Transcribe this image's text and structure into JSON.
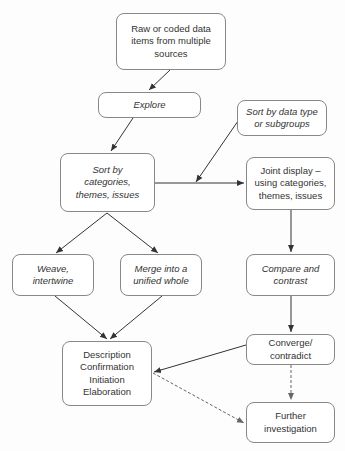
{
  "diagram": {
    "type": "flowchart",
    "nodes": [
      {
        "id": "raw",
        "text": "Raw or coded data\nitems from multiple\nsources",
        "italic": false
      },
      {
        "id": "explore",
        "text": "Explore",
        "italic": true
      },
      {
        "id": "sort_type",
        "text": "Sort by data type\nor subgroups",
        "italic": true
      },
      {
        "id": "sort_cat",
        "text": "Sort by\ncategories,\nthemes, issues",
        "italic": true
      },
      {
        "id": "joint",
        "text": "Joint display –\nusing categories,\nthemes, issues",
        "italic": false
      },
      {
        "id": "weave",
        "text": "Weave,\nintertwine",
        "italic": true
      },
      {
        "id": "merge",
        "text": "Merge into a\nunified whole",
        "italic": true
      },
      {
        "id": "compare",
        "text": "Compare and\ncontrast",
        "italic": true
      },
      {
        "id": "converge",
        "text": "Converge/\ncontradict",
        "italic": false
      },
      {
        "id": "description",
        "text": "Description\nConfirmation\nInitiation\nElaboration",
        "italic": false
      },
      {
        "id": "further",
        "text": "Further\ninvestigation",
        "italic": false
      }
    ],
    "edges": [
      {
        "from": "raw",
        "to": "explore",
        "style": "solid"
      },
      {
        "from": "explore",
        "to": "sort_cat",
        "style": "solid"
      },
      {
        "from": "sort_type",
        "to": "sort_cat-joint edge",
        "style": "solid"
      },
      {
        "from": "sort_cat",
        "to": "joint",
        "style": "solid"
      },
      {
        "from": "sort_cat",
        "to": "weave",
        "style": "solid"
      },
      {
        "from": "sort_cat",
        "to": "merge",
        "style": "solid"
      },
      {
        "from": "joint",
        "to": "compare",
        "style": "solid"
      },
      {
        "from": "weave",
        "to": "description",
        "style": "solid"
      },
      {
        "from": "merge",
        "to": "description",
        "style": "solid"
      },
      {
        "from": "compare",
        "to": "converge",
        "style": "solid"
      },
      {
        "from": "converge",
        "to": "description",
        "style": "solid"
      },
      {
        "from": "converge",
        "to": "further",
        "style": "dashed"
      },
      {
        "from": "description",
        "to": "further",
        "style": "dashed"
      }
    ]
  }
}
